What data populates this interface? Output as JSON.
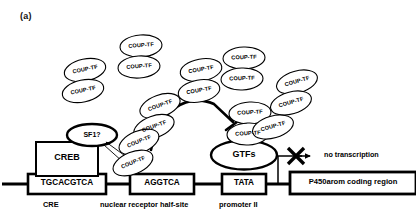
{
  "figure": {
    "panel_label": "(a)",
    "caption_items": {
      "cre": "CRE",
      "nuclear_receptor_half_site": "nuclear receptor half-site",
      "promoter_ii": "promoter II",
      "no_transcription": "no transcription"
    }
  },
  "dna_elements": [
    {
      "id": "cre-box",
      "label": "TGCACGTCA",
      "x": 28,
      "y": 174,
      "w": 78,
      "h": 20
    },
    {
      "id": "nr-half-box",
      "label": "AGGTCA",
      "x": 130,
      "y": 174,
      "w": 64,
      "h": 20
    },
    {
      "id": "tata-box",
      "label": "TATA",
      "x": 222,
      "y": 174,
      "w": 44,
      "h": 20
    },
    {
      "id": "coding-box",
      "label": "P450arom coding region",
      "x": 290,
      "y": 172,
      "w": 124,
      "h": 22
    }
  ],
  "proteins": {
    "creb": {
      "label": "CREB",
      "x": 36,
      "y": 142,
      "w": 62,
      "h": 32
    },
    "sf1": {
      "label": "SF1?",
      "cx": 92,
      "cy": 135,
      "rx": 24,
      "ry": 11
    },
    "gtfs": {
      "label": "GTFs",
      "cx": 244,
      "cy": 155,
      "rx": 32,
      "ry": 14
    }
  },
  "coup_tf": {
    "label": "COUP-TF",
    "dimers": [
      {
        "id": "dimer-1",
        "cx": 85,
        "cy": 70,
        "angle": -12,
        "gap": 21
      },
      {
        "id": "dimer-2",
        "cx": 141,
        "cy": 46,
        "angle": -4,
        "gap": 21
      },
      {
        "id": "dimer-3",
        "cx": 201,
        "cy": 70,
        "angle": -10,
        "gap": 21
      },
      {
        "id": "dimer-4",
        "cx": 244,
        "cy": 58,
        "angle": -2,
        "gap": 21
      },
      {
        "id": "dimer-5",
        "cx": 297,
        "cy": 82,
        "angle": -16,
        "gap": 21
      },
      {
        "id": "dimer-6",
        "cx": 160,
        "cy": 106,
        "angle": -20,
        "gap": 21
      },
      {
        "id": "dimer-7",
        "cx": 250,
        "cy": 113,
        "angle": -3,
        "gap": 21
      },
      {
        "id": "dimer-8",
        "cx": 139,
        "cy": 142,
        "angle": -22,
        "gap": 21
      }
    ],
    "singles": [
      {
        "id": "single-1",
        "cx": 273,
        "cy": 127,
        "angle": -16
      }
    ]
  },
  "annotations": {
    "repression_minus": "_",
    "block_marker": "X"
  },
  "colors": {
    "stroke": "#000000",
    "background": "#ffffff",
    "text": "#000000"
  }
}
